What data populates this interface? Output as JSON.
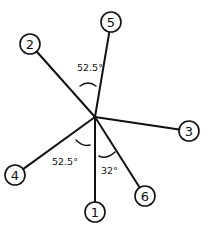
{
  "diagram": {
    "type": "radial-spoke-diagram",
    "hub": {
      "x": 95,
      "y": 117
    },
    "nodes": [
      {
        "id": "1",
        "label": "1",
        "x": 95,
        "y": 212,
        "r": 10
      },
      {
        "id": "2",
        "label": "2",
        "x": 30,
        "y": 44,
        "r": 10
      },
      {
        "id": "3",
        "label": "3",
        "x": 189,
        "y": 131,
        "r": 10
      },
      {
        "id": "4",
        "label": "4",
        "x": 15,
        "y": 175,
        "r": 10
      },
      {
        "id": "5",
        "label": "5",
        "x": 111,
        "y": 22,
        "r": 10
      },
      {
        "id": "6",
        "label": "6",
        "x": 145,
        "y": 196,
        "r": 10
      }
    ],
    "angles": [
      {
        "between": [
          "2",
          "5"
        ],
        "label": "52.5°",
        "label_x": 77,
        "label_y": 71,
        "arc": "M 80 86 Q 88 80 96 86"
      },
      {
        "between": [
          "4",
          "1"
        ],
        "label": "52.5°",
        "label_x": 52,
        "label_y": 165,
        "arc": "M 76 140 Q 83 147 90 145"
      },
      {
        "between": [
          "1",
          "6"
        ],
        "label": "32°",
        "label_x": 101,
        "label_y": 174,
        "arc": "M 99 156 Q 106 160 115 152"
      }
    ]
  }
}
